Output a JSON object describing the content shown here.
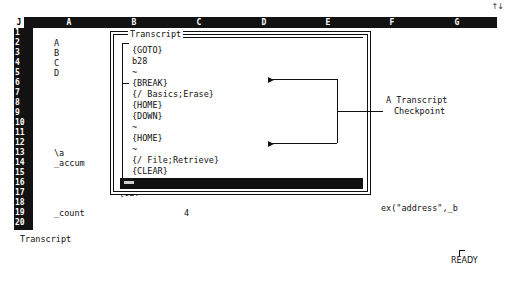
{
  "app": {
    "name": "Quattro Pro spreadsheet",
    "scroll_indicator": "↑↓",
    "mode_indicator": "READY"
  },
  "sheet": {
    "corner_label": "J",
    "column_headers": [
      "A",
      "B",
      "C",
      "D",
      "E",
      "F",
      "G"
    ],
    "row_numbers": [
      "1",
      "2",
      "3",
      "4",
      "5",
      "6",
      "7",
      "8",
      "9",
      "10",
      "11",
      "12",
      "13",
      "14",
      "15",
      "16",
      "17",
      "18",
      "19",
      "20"
    ],
    "cells": [
      {
        "row": 1,
        "col": "B",
        "text": "_no"
      },
      {
        "row": 2,
        "col": "A",
        "text": "A"
      },
      {
        "row": 3,
        "col": "A",
        "text": "B"
      },
      {
        "row": 4,
        "col": "A",
        "text": "C"
      },
      {
        "row": 5,
        "col": "A",
        "text": "D"
      },
      {
        "row": 9,
        "col": "B",
        "text": "{LE"
      },
      {
        "row": 10,
        "col": "B",
        "text": "{LE"
      },
      {
        "row": 11,
        "col": "B",
        "text": "{GE"
      },
      {
        "row": 13,
        "col": "A",
        "text": "\\a"
      },
      {
        "row": 13,
        "col": "B",
        "text": "{GO"
      },
      {
        "row": 14,
        "col": "A",
        "text": "_accum"
      },
      {
        "row": 14,
        "col": "B",
        "text": "{DO"
      },
      {
        "row": 15,
        "col": "B",
        "text": "{LE"
      },
      {
        "row": 16,
        "col": "B",
        "text": "{LE"
      },
      {
        "row": 17,
        "col": "B",
        "text": "{GET"
      },
      {
        "row": 19,
        "col": "A",
        "text": "_count"
      },
      {
        "row": 19,
        "col": "C",
        "text": "4"
      }
    ]
  },
  "dialog": {
    "title": "Transcript",
    "lines": [
      "{GOTO}",
      "b28",
      "~",
      "{BREAK}",
      "{/ Basics;Erase}",
      "{HOME}",
      "{DOWN}",
      "~",
      "{HOME}",
      "~",
      "{/ File;Retrieve}",
      "{CLEAR}",
      "C:\\QPRO\\FILE\\ACC_LET.WQ1"
    ]
  },
  "annotation": {
    "label_line1": "A Transcript",
    "label_line2": "Checkpoint"
  },
  "status": {
    "left_label": "Transcript",
    "formula_fragment": "ex(\"address\",_b"
  },
  "colors": {
    "header_bg": "#121212",
    "header_fg": "#ffffff",
    "page_bg": "#ffffff",
    "ink": "#111111",
    "selection_bg": "#111111"
  }
}
